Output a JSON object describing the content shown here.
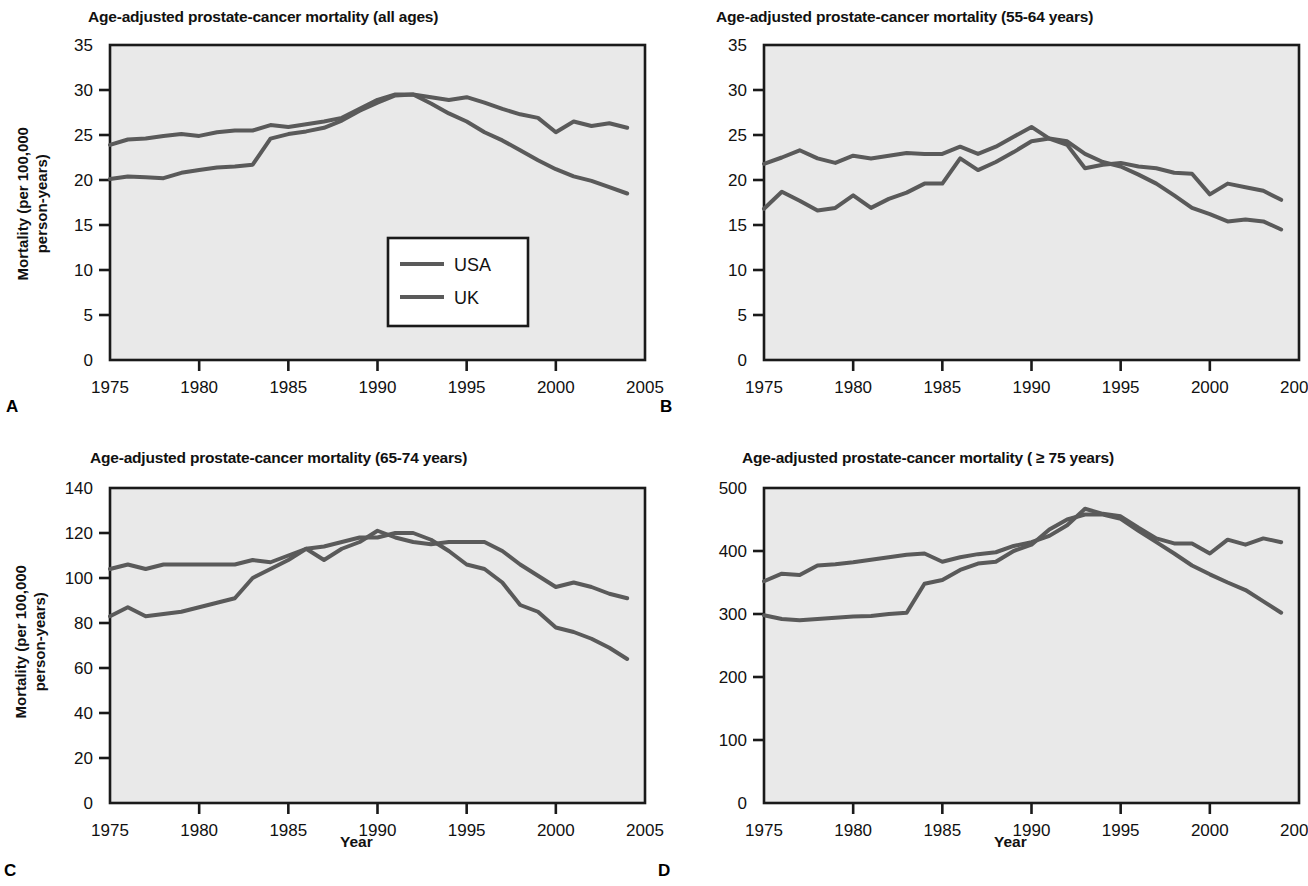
{
  "figure": {
    "background": "#ffffff",
    "plot_background": "#e9e9e9",
    "line_color": "#5a5a5a",
    "axis_color": "#1a1a1a"
  },
  "axis_labels": {
    "ylabel_line1": "Mortality (per 100,000",
    "ylabel_line2": "person-years)",
    "ylabel": "Mortality (per 100,000 person-years)",
    "xlabel": "Year"
  },
  "legend": {
    "position": "inside-lower-right",
    "entries": [
      {
        "label": "USA",
        "color": "#5a5a5a"
      },
      {
        "label": "UK",
        "color": "#5a5a5a"
      }
    ]
  },
  "panels": [
    {
      "letter": "A",
      "title": "Age-adjusted prostate-cancer mortality (all ages)",
      "show_ylabel": true,
      "show_xlabel": false,
      "show_legend": true
    },
    {
      "letter": "B",
      "title": "Age-adjusted prostate-cancer mortality (55-64 years)",
      "show_ylabel": false,
      "show_xlabel": false,
      "show_legend": false
    },
    {
      "letter": "C",
      "title": "Age-adjusted prostate-cancer mortality (65-74 years)",
      "show_ylabel": true,
      "show_xlabel": true,
      "show_legend": false
    },
    {
      "letter": "D",
      "title": "Age-adjusted prostate-cancer mortality ( ≥ 75 years)",
      "show_ylabel": false,
      "show_xlabel": true,
      "show_legend": false
    }
  ],
  "chart_data": [
    {
      "panel": "A",
      "type": "line",
      "title": "Age-adjusted prostate-cancer mortality (all ages)",
      "xlabel": "Year",
      "ylabel": "Mortality (per 100,000 person-years)",
      "xlim": [
        1975,
        2005
      ],
      "ylim": [
        0,
        35
      ],
      "xticks": [
        1975,
        1980,
        1985,
        1990,
        1995,
        2000,
        2005
      ],
      "yticks": [
        0,
        5,
        10,
        15,
        20,
        25,
        30,
        35
      ],
      "grid": false,
      "legend": [
        "USA",
        "UK"
      ],
      "x": [
        1975,
        1976,
        1977,
        1978,
        1979,
        1980,
        1981,
        1982,
        1983,
        1984,
        1985,
        1986,
        1987,
        1988,
        1989,
        1990,
        1991,
        1992,
        1993,
        1994,
        1995,
        1996,
        1997,
        1998,
        1999,
        2000,
        2001,
        2002,
        2003,
        2004
      ],
      "series": [
        {
          "name": "USA",
          "values": [
            23.9,
            24.5,
            24.6,
            24.9,
            25.1,
            24.9,
            25.3,
            25.5,
            25.5,
            26.1,
            25.9,
            26.2,
            26.5,
            26.9,
            27.9,
            28.9,
            29.5,
            29.5,
            29.2,
            28.9,
            29.2,
            28.6,
            27.9,
            27.3,
            26.9,
            25.3,
            26.5,
            26.0,
            26.3,
            25.8
          ]
        },
        {
          "name": "UK",
          "values": [
            20.1,
            20.4,
            20.3,
            20.2,
            20.8,
            21.1,
            21.4,
            21.5,
            21.7,
            24.6,
            25.1,
            25.4,
            25.8,
            26.6,
            27.7,
            28.6,
            29.4,
            29.5,
            28.5,
            27.4,
            26.5,
            25.3,
            24.4,
            23.3,
            22.2,
            21.2,
            20.4,
            19.9,
            19.2,
            18.5
          ]
        }
      ]
    },
    {
      "panel": "B",
      "type": "line",
      "title": "Age-adjusted prostate-cancer mortality (55-64 years)",
      "xlabel": "Year",
      "ylabel": "Mortality (per 100,000 person-years)",
      "xlim": [
        1975,
        2005
      ],
      "ylim": [
        0,
        35
      ],
      "xticks": [
        1975,
        1980,
        1985,
        1990,
        1995,
        2000,
        2005
      ],
      "yticks": [
        0,
        5,
        10,
        15,
        20,
        25,
        30,
        35
      ],
      "grid": false,
      "legend": [
        "USA",
        "UK"
      ],
      "x": [
        1975,
        1976,
        1977,
        1978,
        1979,
        1980,
        1981,
        1982,
        1983,
        1984,
        1985,
        1986,
        1987,
        1988,
        1989,
        1990,
        1991,
        1992,
        1993,
        1994,
        1995,
        1996,
        1997,
        1998,
        1999,
        2000,
        2001,
        2002,
        2003,
        2004
      ],
      "series": [
        {
          "name": "USA",
          "values": [
            21.8,
            22.5,
            23.3,
            22.4,
            21.9,
            22.7,
            22.4,
            22.7,
            23.0,
            22.9,
            22.9,
            23.7,
            22.9,
            23.7,
            24.8,
            25.9,
            24.6,
            23.9,
            21.3,
            21.7,
            21.9,
            21.5,
            21.3,
            20.8,
            20.7,
            18.4,
            19.6,
            19.2,
            18.8,
            17.8
          ]
        },
        {
          "name": "UK",
          "values": [
            16.8,
            18.7,
            17.7,
            16.6,
            16.9,
            18.3,
            16.9,
            17.9,
            18.6,
            19.6,
            19.6,
            22.4,
            21.1,
            22.0,
            23.1,
            24.3,
            24.6,
            24.3,
            22.9,
            22.0,
            21.5,
            20.6,
            19.6,
            18.3,
            16.9,
            16.2,
            15.4,
            15.6,
            15.4,
            14.5
          ]
        }
      ]
    },
    {
      "panel": "C",
      "type": "line",
      "title": "Age-adjusted prostate-cancer mortality (65-74 years)",
      "xlabel": "Year",
      "ylabel": "Mortality (per 100,000 person-years)",
      "xlim": [
        1975,
        2005
      ],
      "ylim": [
        0,
        140
      ],
      "xticks": [
        1975,
        1980,
        1985,
        1990,
        1995,
        2000,
        2005
      ],
      "yticks": [
        0,
        20,
        40,
        60,
        80,
        100,
        120,
        140
      ],
      "grid": false,
      "legend": [
        "USA",
        "UK"
      ],
      "x": [
        1975,
        1976,
        1977,
        1978,
        1979,
        1980,
        1981,
        1982,
        1983,
        1984,
        1985,
        1986,
        1987,
        1988,
        1989,
        1990,
        1991,
        1992,
        1993,
        1994,
        1995,
        1996,
        1997,
        1998,
        1999,
        2000,
        2001,
        2002,
        2003,
        2004
      ],
      "series": [
        {
          "name": "USA",
          "values": [
            104,
            106,
            104,
            106,
            106,
            106,
            106,
            106,
            108,
            107,
            110,
            113,
            108,
            113,
            116,
            121,
            118,
            116,
            115,
            116,
            116,
            116,
            112,
            106,
            101,
            96,
            98,
            96,
            93,
            91
          ]
        },
        {
          "name": "UK",
          "values": [
            83,
            87,
            83,
            84,
            85,
            87,
            89,
            91,
            100,
            104,
            108,
            113,
            114,
            116,
            118,
            118,
            120,
            120,
            117,
            112,
            106,
            104,
            98,
            88,
            85,
            78,
            76,
            73,
            69,
            64
          ]
        }
      ]
    },
    {
      "panel": "D",
      "type": "line",
      "title": "Age-adjusted prostate-cancer mortality ( ≥ 75 years)",
      "xlabel": "Year",
      "ylabel": "Mortality (per 100,000 person-years)",
      "xlim": [
        1975,
        2005
      ],
      "ylim": [
        0,
        500
      ],
      "xticks": [
        1975,
        1980,
        1985,
        1990,
        1995,
        2000,
        2005
      ],
      "yticks": [
        0,
        100,
        200,
        300,
        400,
        500
      ],
      "grid": false,
      "legend": [
        "USA",
        "UK"
      ],
      "x": [
        1975,
        1976,
        1977,
        1978,
        1979,
        1980,
        1981,
        1982,
        1983,
        1984,
        1985,
        1986,
        1987,
        1988,
        1989,
        1990,
        1991,
        1992,
        1993,
        1994,
        1995,
        1996,
        1997,
        1998,
        1999,
        2000,
        2001,
        2002,
        2003,
        2004
      ],
      "series": [
        {
          "name": "USA",
          "values": [
            352,
            364,
            362,
            377,
            379,
            382,
            386,
            390,
            394,
            396,
            383,
            390,
            395,
            398,
            408,
            414,
            424,
            441,
            467,
            459,
            455,
            437,
            420,
            412,
            412,
            396,
            418,
            410,
            420,
            414
          ]
        },
        {
          "name": "UK",
          "values": [
            298,
            292,
            290,
            292,
            294,
            296,
            297,
            300,
            302,
            348,
            354,
            370,
            380,
            383,
            400,
            410,
            434,
            450,
            458,
            458,
            451,
            432,
            414,
            396,
            377,
            363,
            350,
            338,
            320,
            302
          ]
        }
      ]
    }
  ]
}
